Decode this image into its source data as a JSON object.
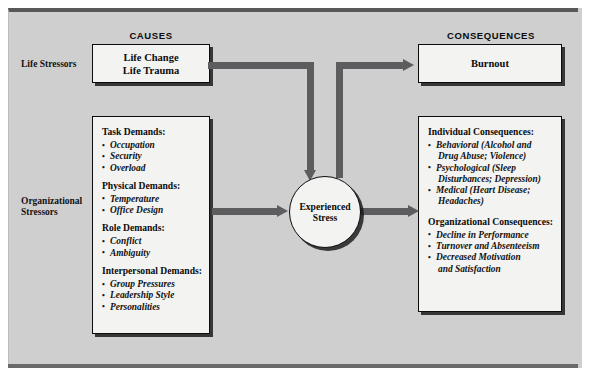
{
  "diagram": {
    "headers": {
      "causes": "CAUSES",
      "consequences": "CONSEQUENCES"
    },
    "row_labels": {
      "life_stressors": "Life Stressors",
      "organizational_stressors_line1": "Organizational",
      "organizational_stressors_line2": "Stressors"
    },
    "life_stressors_box": {
      "line1": "Life Change",
      "line2": "Life Trauma"
    },
    "burnout_box": {
      "label": "Burnout"
    },
    "center_node": {
      "line1": "Experienced",
      "line2": "Stress"
    },
    "stressors_box": {
      "groups": [
        {
          "title": "Task Demands:",
          "items": [
            "Occupation",
            "Security",
            "Overload"
          ]
        },
        {
          "title": "Physical Demands:",
          "items": [
            "Temperature",
            "Office Design"
          ]
        },
        {
          "title": "Role Demands:",
          "items": [
            "Conflict",
            "Ambiguity"
          ]
        },
        {
          "title": "Interpersonal Demands:",
          "items": [
            "Group Pressures",
            "Leadership Style",
            "Personalities"
          ]
        }
      ]
    },
    "consequences_box": {
      "groups": [
        {
          "title": "Individual Consequences:",
          "items": [
            {
              "line1": "Behavioral (Alcohol and",
              "line2": "Drug Abuse; Violence)"
            },
            {
              "line1": "Psychological (Sleep",
              "line2": "Disturbances; Depression)"
            },
            {
              "line1": "Medical (Heart Disease;",
              "line2": "Headaches)"
            }
          ]
        },
        {
          "title": "Organizational Consequences:",
          "items": [
            {
              "line1": "Decline in Performance",
              "line2": ""
            },
            {
              "line1": "Turnover and Absenteeism",
              "line2": ""
            },
            {
              "line1": "Decreased Motivation",
              "line2": "and Satisfaction"
            }
          ]
        }
      ]
    },
    "colors": {
      "panel_background": "#cfcfcf",
      "box_fill": "#f3f3f1",
      "connector": "#5d5d5f",
      "outline": "#0c0c0c"
    }
  }
}
